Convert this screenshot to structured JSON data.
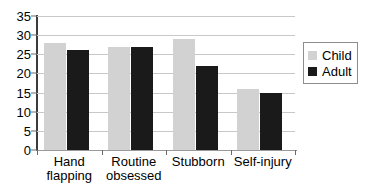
{
  "chart_data": {
    "type": "bar",
    "title": "",
    "subtitle": "",
    "xlabel": "",
    "ylabel": "",
    "categories": [
      "Hand flapping",
      "Routine obsessed",
      "Stubborn",
      "Self-injury"
    ],
    "category_lines": [
      [
        "Hand",
        "flapping"
      ],
      [
        "Routine",
        "obsessed"
      ],
      [
        "Stubborn"
      ],
      [
        "Self-injury"
      ]
    ],
    "series": [
      {
        "name": "Child",
        "color": "#d2d2d2",
        "values": [
          28,
          27,
          29,
          16
        ]
      },
      {
        "name": "Adult",
        "color": "#1a1a1a",
        "values": [
          26,
          27,
          22,
          15
        ]
      }
    ],
    "ylim": [
      0,
      35
    ],
    "ytick_step": 5,
    "yticks": [
      0,
      5,
      10,
      15,
      20,
      25,
      30,
      35
    ],
    "ytick_labels": [
      "0",
      "5",
      "10",
      "15",
      "20",
      "25",
      "30",
      "35"
    ],
    "grid": {
      "horizontal": true,
      "vertical": false,
      "color": "#c8c8c8"
    },
    "legend": {
      "position": "right",
      "bordered": true,
      "entries": [
        {
          "label": "Child",
          "color": "#d2d2d2"
        },
        {
          "label": "Adult",
          "color": "#1a1a1a"
        }
      ]
    },
    "axis_color": "#3b3b3b",
    "background": "#ffffff"
  }
}
